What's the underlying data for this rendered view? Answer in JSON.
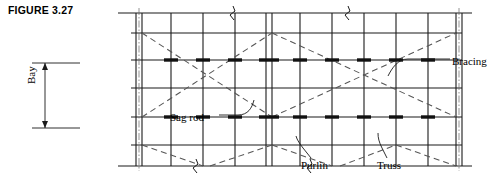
{
  "figure": {
    "label": "FIGURE 3.27"
  },
  "callouts": {
    "bracing": "Bracing",
    "sag_rod": "Sag rod",
    "purlin": "Purlin",
    "truss": "Truss",
    "bay": "Bay"
  },
  "diagram": {
    "type": "roof-framing-plan",
    "colors": {
      "line": "#1a1a1a",
      "dashed": "#555555",
      "background": "#ffffff"
    },
    "frame": {
      "left": 131,
      "right": 466,
      "top": 13,
      "bottom": 166
    },
    "purlin_rows_y": [
      13,
      33,
      60,
      88,
      117,
      145,
      166
    ],
    "truss_columns_x": [
      136,
      142,
      171,
      203,
      235,
      266,
      272,
      300,
      332,
      364,
      396,
      428,
      456,
      462
    ],
    "bracing_bays": [
      {
        "x_start": 142,
        "x_end": 272,
        "y_top": 33,
        "y_bottom": 117
      },
      {
        "x_start": 272,
        "x_end": 456,
        "y_top": 33,
        "y_bottom": 117
      }
    ],
    "sag_rod_rows_y": [
      60,
      117
    ],
    "break_symbols_top_x": [
      233,
      348
    ],
    "break_symbols_bottom_x": [
      196,
      310
    ],
    "bay_dimension": {
      "y_top": 63,
      "y_bottom": 128,
      "x": 45
    }
  }
}
